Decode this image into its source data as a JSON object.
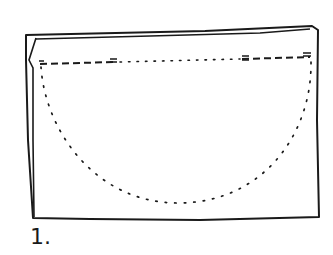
{
  "diagram": {
    "step_label": "1.",
    "colors": {
      "ink": "#1a1a1a",
      "background": "#ffffff"
    },
    "elements": {
      "fabric": "folded rectangular fabric piece",
      "seam_line": "dashed stitching line across top with dotted gap in middle",
      "cut_line": "dotted semicircle below seam line"
    }
  }
}
